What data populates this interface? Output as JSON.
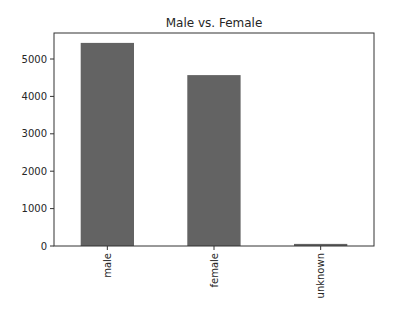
{
  "chart_data": {
    "type": "bar",
    "title": "Male vs. Female",
    "xlabel": "",
    "ylabel": "",
    "categories": [
      "male",
      "female",
      "unknown"
    ],
    "values": [
      5430,
      4570,
      55
    ],
    "ylim": [
      0,
      5650
    ],
    "yticks": [
      0,
      1000,
      2000,
      3000,
      4000,
      5000
    ],
    "xtick_rotation": 90,
    "grid": false,
    "legend": null,
    "bar_color": "#636363"
  }
}
